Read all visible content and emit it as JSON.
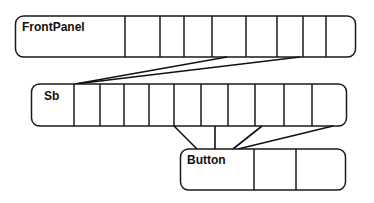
{
  "diagram": {
    "nodes": [
      {
        "id": "frontpanel",
        "label": "FrontPanel",
        "slots": 8
      },
      {
        "id": "sb",
        "label": "Sb",
        "slots": 11
      },
      {
        "id": "button",
        "label": "Button",
        "slots": 2
      }
    ],
    "edges": [
      {
        "from": "frontpanel",
        "to": "sb",
        "count": 2
      },
      {
        "from": "sb",
        "to": "button",
        "count": 4
      }
    ],
    "colors": {
      "stroke": "#1a1a1a",
      "background": "#ffffff"
    }
  }
}
